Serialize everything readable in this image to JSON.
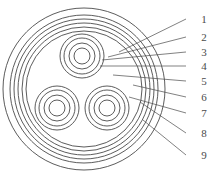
{
  "diagram": {
    "type": "technical-cross-section",
    "stroke_color": "#4a4a4a",
    "fill_color": "#ffffff",
    "background": "#ffffff",
    "canvas": {
      "width": 215,
      "height": 176
    }
  },
  "cable": {
    "center": {
      "x": 84,
      "y": 89
    },
    "outer_layers": [
      {
        "index": 1,
        "radius": 81
      },
      {
        "index": 2,
        "radius": 74
      },
      {
        "index": 3,
        "radius": 70
      },
      {
        "index": 4,
        "radius": 66
      },
      {
        "index": 5,
        "radius": 62
      },
      {
        "index": 6,
        "radius": 58
      }
    ],
    "conductor_rings": [
      22,
      18,
      13,
      8
    ],
    "conductors": [
      {
        "name": "conductor-top",
        "cx": 82,
        "cy": 56
      },
      {
        "name": "conductor-bottom-left",
        "cx": 57,
        "cy": 108
      },
      {
        "name": "conductor-bottom-right",
        "cx": 107,
        "cy": 108
      }
    ]
  },
  "callouts": [
    {
      "id": "1",
      "label": "1",
      "label_x": 204,
      "label_y": 19,
      "line_x1": 186,
      "line_y1": 19,
      "line_x2": 119,
      "line_y2": 52
    },
    {
      "id": "2",
      "label": "2",
      "label_x": 204,
      "label_y": 37,
      "line_x1": 186,
      "line_y1": 37,
      "line_x2": 108,
      "line_y2": 57
    },
    {
      "id": "3",
      "label": "3",
      "label_x": 204,
      "label_y": 52,
      "line_x1": 186,
      "line_y1": 52,
      "line_x2": 102,
      "line_y2": 60
    },
    {
      "id": "4",
      "label": "4",
      "label_x": 204,
      "label_y": 66,
      "line_x1": 186,
      "line_y1": 66,
      "line_x2": 100,
      "line_y2": 66
    },
    {
      "id": "5",
      "label": "5",
      "label_x": 204,
      "label_y": 81,
      "line_x1": 186,
      "line_y1": 81,
      "line_x2": 113,
      "line_y2": 75
    },
    {
      "id": "6",
      "label": "6",
      "label_x": 204,
      "label_y": 97,
      "line_x1": 186,
      "line_y1": 97,
      "line_x2": 133,
      "line_y2": 85
    },
    {
      "id": "7",
      "label": "7",
      "label_x": 204,
      "label_y": 113,
      "line_x1": 186,
      "line_y1": 113,
      "line_x2": 129,
      "line_y2": 97
    },
    {
      "id": "8",
      "label": "8",
      "label_x": 204,
      "label_y": 133,
      "line_x1": 186,
      "line_y1": 133,
      "line_x2": 140,
      "line_y2": 102
    },
    {
      "id": "9",
      "label": "9",
      "label_x": 204,
      "label_y": 155,
      "line_x1": 186,
      "line_y1": 155,
      "line_x2": 143,
      "line_y2": 120
    }
  ]
}
